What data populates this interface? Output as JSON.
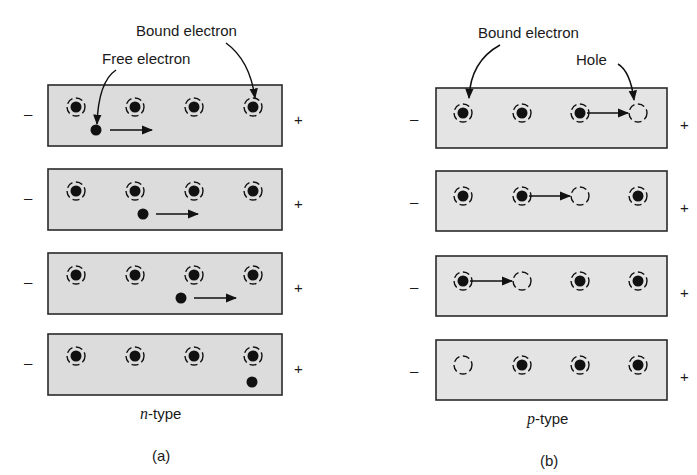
{
  "panel_a": {
    "caption": "(a)",
    "type_label_italic": "n",
    "type_label_rest": "-type",
    "callouts": {
      "free_electron": "Free electron",
      "bound_electron": "Bound electron"
    },
    "rows": [
      {
        "atoms": [
          "bound",
          "bound",
          "bound",
          "bound"
        ],
        "free_electron_x": 96,
        "arrow": [
          110,
          152
        ]
      },
      {
        "atoms": [
          "bound",
          "bound",
          "bound",
          "bound"
        ],
        "free_electron_x": 143,
        "arrow": [
          156,
          198
        ]
      },
      {
        "atoms": [
          "bound",
          "bound",
          "bound",
          "bound"
        ],
        "free_electron_x": 181,
        "arrow": [
          194,
          236
        ]
      },
      {
        "atoms": [
          "bound",
          "bound",
          "bound",
          "bound"
        ],
        "free_electron_x": 252,
        "arrow": null
      }
    ],
    "negative_terminal": "–",
    "positive_terminal": "+"
  },
  "panel_b": {
    "caption": "(b)",
    "type_label_italic": "p",
    "type_label_rest": "-type",
    "callouts": {
      "bound_electron": "Bound electron",
      "hole": "Hole"
    },
    "rows": [
      {
        "atoms": [
          "bound",
          "bound",
          "bound",
          "hole"
        ]
      },
      {
        "atoms": [
          "bound",
          "bound",
          "hole",
          "bound"
        ]
      },
      {
        "atoms": [
          "bound",
          "hole",
          "bound",
          "bound"
        ]
      },
      {
        "atoms": [
          "hole",
          "bound",
          "bound",
          "bound"
        ]
      }
    ],
    "negative_terminal": "–",
    "positive_terminal": "+"
  },
  "colors": {
    "box_fill": "#dcdcdc",
    "box_stroke": "#2a2a2a",
    "ink": "#111111"
  }
}
